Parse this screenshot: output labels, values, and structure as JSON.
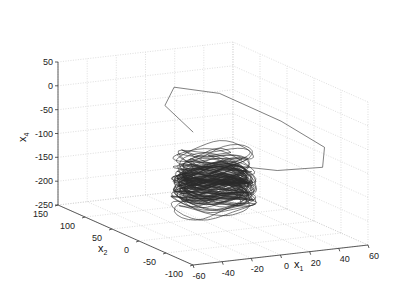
{
  "chart_data": {
    "type": "line3d",
    "title": "",
    "axes": {
      "x": {
        "label": "x",
        "subscript": "1",
        "range": [
          -60,
          60
        ],
        "ticks": [
          -60,
          -40,
          -20,
          0,
          20,
          40,
          60
        ]
      },
      "y": {
        "label": "x",
        "subscript": "2",
        "range": [
          -100,
          150
        ],
        "ticks": [
          -100,
          -50,
          0,
          50,
          100,
          150
        ]
      },
      "z": {
        "label": "x",
        "subscript": "4",
        "range": [
          -250,
          50
        ],
        "ticks": [
          -250,
          -200,
          -150,
          -100,
          -50,
          0,
          50
        ]
      }
    },
    "grid": true,
    "line_color": "#2a2a2a",
    "grid_color": "#c8c8c8",
    "attractor": {
      "center": {
        "x1": -5,
        "x2": 10,
        "x4": -150
      },
      "radius_x1": 22,
      "radius_x2": 40,
      "x4_range": [
        -215,
        -85
      ],
      "transient_loop_peak_x4": 20
    }
  }
}
